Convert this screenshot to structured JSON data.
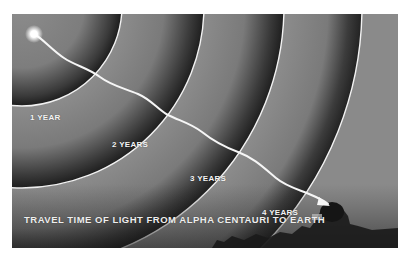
{
  "figure": {
    "caption": "TRAVEL TIME OF LIGHT FROM ALPHA CENTAURI TO EARTH",
    "source_label": "Alpha Centauri",
    "destination_label": "Earth",
    "rings": [
      {
        "label": "1 YEAR",
        "radius": 100
      },
      {
        "label": "2 YEARS",
        "radius": 182
      },
      {
        "label": "3 YEARS",
        "radius": 262
      },
      {
        "label": "4 YEARS",
        "radius": 340
      }
    ],
    "colors": {
      "background": "#8a8a8a",
      "ring_line": "#f2f2f2",
      "shadow": "#1e1e1e",
      "path": "#f6f6f6",
      "text": "#f4f4f4"
    }
  }
}
